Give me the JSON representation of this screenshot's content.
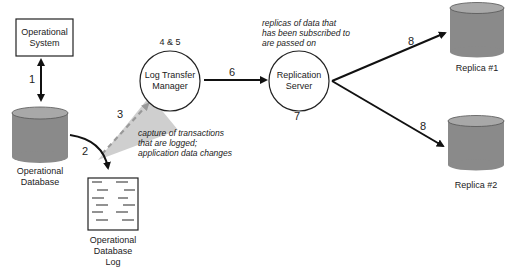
{
  "nodes": {
    "operational_system": {
      "label_line1": "Operational",
      "label_line2": "System"
    },
    "operational_database": {
      "label_line1": "Operational",
      "label_line2": "Database"
    },
    "log_transfer_manager": {
      "label_line1": "Log Transfer",
      "label_line2": "Manager",
      "step": "4 & 5"
    },
    "replication_server": {
      "label_line1": "Replication",
      "label_line2": "Server",
      "step": "7"
    },
    "operational_database_log": {
      "label_line1": "Operational",
      "label_line2": "Database",
      "label_line3": "Log"
    },
    "replica_1": {
      "label": "Replica #1"
    },
    "replica_2": {
      "label": "Replica #2"
    }
  },
  "edges": {
    "e1": {
      "step": "1",
      "from": "Operational System",
      "to": "Operational Database",
      "bidirectional": true
    },
    "e2": {
      "step": "2",
      "from": "Operational Database",
      "to": "Operational Database Log"
    },
    "e3": {
      "step": "3",
      "from": "Operational Database",
      "to": "Log Transfer Manager",
      "style": "dashed"
    },
    "e6": {
      "step": "6",
      "from": "Log Transfer Manager",
      "to": "Replication Server"
    },
    "e8a": {
      "step": "8",
      "from": "Replication Server",
      "to": "Replica #1"
    },
    "e8b": {
      "step": "8",
      "from": "Replication Server",
      "to": "Replica #2"
    }
  },
  "annotations": {
    "capture": [
      "capture of transactions",
      "that are logged;",
      "application data changes"
    ],
    "replicas": [
      "replicas of data that",
      "has been subscribed to",
      "are passed on"
    ]
  },
  "colors": {
    "cylinder_body": "#8a8a8a",
    "cylinder_top": "#a8a8a8",
    "beam": "#c8c8c8",
    "stroke": "#111111"
  }
}
